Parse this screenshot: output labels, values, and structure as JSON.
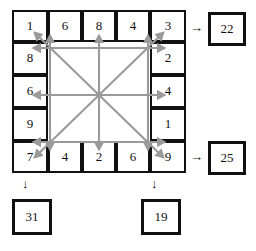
{
  "puzzle": {
    "grid_label": "5x5 bordered number frame",
    "top_row": [
      "1",
      "6",
      "8",
      "4",
      "3"
    ],
    "left_col": [
      "1",
      "8",
      "6",
      "9",
      "7"
    ],
    "right_col": [
      "3",
      "2",
      "4",
      "1",
      "9"
    ],
    "bottom_row": [
      "7",
      "4",
      "2",
      "6",
      "9"
    ],
    "cells": {
      "r0": [
        "1",
        "6",
        "8",
        "4",
        "3"
      ],
      "r1c0": "8",
      "r1c4": "2",
      "r2c0": "6",
      "r2c4": "4",
      "r3c0": "9",
      "r3c4": "1",
      "r4": [
        "7",
        "4",
        "2",
        "6",
        "9"
      ]
    }
  },
  "results": {
    "right_top": {
      "value": "22",
      "arrow": "right-arrow-icon"
    },
    "right_bottom": {
      "value": "25",
      "arrow": "right-arrow-icon"
    },
    "bottom_left": {
      "value": "31",
      "arrow": "down-arrow-icon"
    },
    "bottom_right": {
      "value": "19",
      "arrow": "down-arrow-icon"
    }
  },
  "arrows": {
    "color": "#9a9a9a",
    "description": "eight arrows radiating from centre plus axial grid lines inside the frame",
    "glyph_right": "→",
    "glyph_down": "↓"
  },
  "colors": {
    "ink": "#111111",
    "arrow_gray": "#9a9a9a",
    "paper": "#ffffff"
  }
}
